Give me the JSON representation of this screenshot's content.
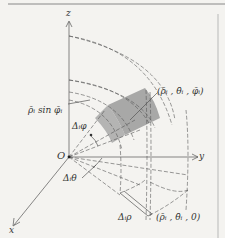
{
  "figure": {
    "type": "spherical-coordinate volume element diagram",
    "axes": {
      "z_label": "z",
      "y_label": "y",
      "x_label": "x",
      "origin_label": "O"
    },
    "annotations": {
      "rho_sin_phi": "ρ̄ᵢ sin φ̄ᵢ",
      "delta_phi": "Δᵢφ",
      "delta_theta": "Δᵢθ",
      "delta_rho": "Δᵢρ",
      "point_label": "(ρ̄ᵢ , θ̄ᵢ , φ̄ᵢ)",
      "projection_label": "(ρ̄ᵢ , θ̄ᵢ , 0)"
    },
    "colors": {
      "background": "#f4f3f0",
      "line": "#555555",
      "shaded_region": "#9a9a9a",
      "border": "#888888"
    }
  }
}
